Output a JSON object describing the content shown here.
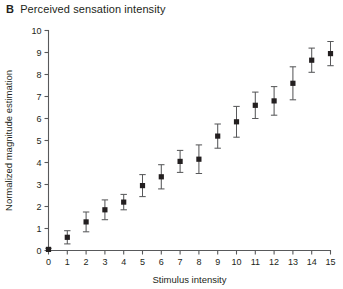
{
  "panel": {
    "letter": "B",
    "title": "Perceived sensation intensity"
  },
  "chart_data": {
    "type": "scatter",
    "title": "Perceived sensation intensity",
    "xlabel": "Stimulus intensity",
    "ylabel": "Normalized magnitude estimation",
    "xlim": [
      0,
      15
    ],
    "ylim": [
      0,
      10
    ],
    "xticks": [
      0,
      1,
      2,
      3,
      4,
      5,
      6,
      7,
      8,
      9,
      10,
      11,
      12,
      13,
      14,
      15
    ],
    "yticks": [
      0,
      1,
      2,
      3,
      4,
      5,
      6,
      7,
      8,
      9,
      10
    ],
    "xtick_labels": [
      "0",
      "1",
      "2",
      "3",
      "4",
      "5",
      "6",
      "7",
      "8",
      "9",
      "10",
      "11",
      "12",
      "13",
      "14",
      "15"
    ],
    "ytick_labels": [
      "0",
      "1",
      "2",
      "3",
      "4",
      "5",
      "6",
      "7",
      "8",
      "9",
      "10"
    ],
    "grid": false,
    "legend": "none",
    "error_bars": "symmetric-sd",
    "marker": "filled-square",
    "marker_color": "#231f20",
    "x": [
      0,
      1,
      2,
      3,
      4,
      5,
      6,
      7,
      8,
      9,
      10,
      11,
      12,
      13,
      14,
      15
    ],
    "values": [
      0.05,
      0.6,
      1.3,
      1.85,
      2.2,
      2.95,
      3.35,
      4.05,
      4.15,
      5.2,
      5.85,
      6.6,
      6.8,
      7.6,
      8.65,
      8.95
    ],
    "errors": [
      0.05,
      0.3,
      0.45,
      0.45,
      0.35,
      0.5,
      0.55,
      0.5,
      0.65,
      0.55,
      0.7,
      0.6,
      0.65,
      0.75,
      0.55,
      0.55
    ],
    "series": [
      {
        "name": "Normalized magnitude estimation",
        "values": [
          0.05,
          0.6,
          1.3,
          1.85,
          2.2,
          2.95,
          3.35,
          4.05,
          4.15,
          5.2,
          5.85,
          6.6,
          6.8,
          7.6,
          8.65,
          8.95
        ],
        "errors": [
          0.05,
          0.3,
          0.45,
          0.45,
          0.35,
          0.5,
          0.55,
          0.5,
          0.65,
          0.55,
          0.7,
          0.6,
          0.65,
          0.75,
          0.55,
          0.55
        ]
      }
    ]
  },
  "colors": {
    "axis": "#58595b",
    "marker": "#231f20",
    "text": "#231f20",
    "background": "#ffffff"
  }
}
